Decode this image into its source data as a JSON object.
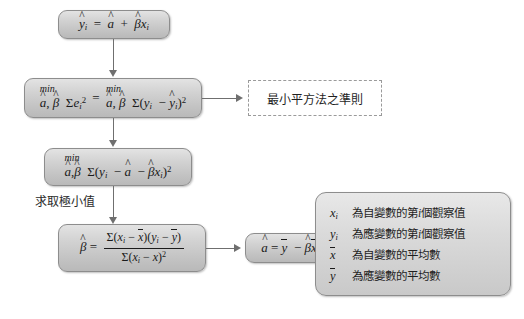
{
  "diagram": {
    "boxes": {
      "regression_line": {
        "id": "regression-line-box",
        "formula_plain": "ŷi = â + β̂xi"
      },
      "sse_equivalence": {
        "id": "sse-equivalence-box",
        "min_label_left": "min",
        "min_label_right": "min",
        "lhs_plain": "â, β̂ Σei²",
        "rhs_plain": "â, β̂ Σ(yi − ŷi)²",
        "equals": "="
      },
      "criterion_note": {
        "id": "criterion-note-box",
        "text": "最小平方法之準則",
        "style": "dashed"
      },
      "expanded_objective": {
        "id": "expanded-objective-box",
        "min_label": "min",
        "formula_plain": "â, β̂ Σ(yi − â − β̂xi)²"
      },
      "minimize_note": {
        "id": "minimize-note-label",
        "text": "求取極小值"
      },
      "beta_hat": {
        "id": "beta-hat-box",
        "lhs_plain": "β̂ =",
        "numerator_plain": "Σ(xi − x̄)(yi − ȳ)",
        "denominator_plain": "Σ(xi − x̄)²"
      },
      "alpha_hat": {
        "id": "alpha-hat-box",
        "formula_plain": "â = ȳ − β̂x̄"
      }
    },
    "legend": {
      "id": "symbol-legend-box",
      "items": [
        {
          "symbol_plain": "xi",
          "text_pre": "為自變數的第",
          "text_it": "i",
          "text_post": "個觀察值"
        },
        {
          "symbol_plain": "yi",
          "text_pre": "為應變數的第",
          "text_it": "i",
          "text_post": "個觀察值"
        },
        {
          "symbol_plain": "x̄",
          "text_pre": "為自變數的平均數",
          "text_it": "",
          "text_post": ""
        },
        {
          "symbol_plain": "ȳ",
          "text_pre": "為應變數的平均數",
          "text_it": "",
          "text_post": ""
        }
      ]
    },
    "connectors": [
      {
        "id": "arrow-line-to-sse",
        "type": "vertical-arrow-down"
      },
      {
        "id": "arrow-sse-to-criterion",
        "type": "horizontal-arrow-right"
      },
      {
        "id": "arrow-sse-to-expanded",
        "type": "vertical-arrow-down"
      },
      {
        "id": "arrow-expanded-to-beta",
        "type": "vertical-arrow-down"
      },
      {
        "id": "arrow-beta-to-alpha",
        "type": "horizontal-arrow-right"
      }
    ],
    "colors": {
      "box_fill_top": "#e3e3e3",
      "box_fill_bottom": "#b9b9b9",
      "box_border": "#8d8d8d",
      "connector": "#6f6f6f",
      "background": "#ffffff",
      "text": "#1a1a1a"
    }
  }
}
